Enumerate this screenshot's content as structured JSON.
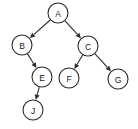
{
  "diagram": {
    "type": "directed-graph",
    "canvas": {
      "width": 138,
      "height": 129,
      "background": "#ffffff"
    },
    "style": {
      "node_fill": "#ffffff",
      "node_stroke": "#2b2b2b",
      "edge_color": "#2b2b2b",
      "label_color": "#1a1a1a",
      "node_radius": 10
    },
    "nodes": [
      {
        "id": "A",
        "label": "A",
        "cx": 58,
        "cy": 13,
        "r": 10
      },
      {
        "id": "B",
        "label": "B",
        "cx": 22,
        "cy": 45,
        "r": 10
      },
      {
        "id": "C",
        "label": "C",
        "cx": 88,
        "cy": 46,
        "r": 10
      },
      {
        "id": "E",
        "label": "E",
        "cx": 42,
        "cy": 77,
        "r": 10
      },
      {
        "id": "F",
        "label": "F",
        "cx": 69,
        "cy": 78,
        "r": 10
      },
      {
        "id": "G",
        "label": "G",
        "cx": 118,
        "cy": 79,
        "r": 10
      },
      {
        "id": "J",
        "label": "J",
        "cx": 33,
        "cy": 110,
        "r": 10
      }
    ],
    "edges": [
      {
        "id": "A-B",
        "from": "A",
        "to": "B",
        "directed": true
      },
      {
        "id": "A-C",
        "from": "A",
        "to": "C",
        "directed": true
      },
      {
        "id": "B-E",
        "from": "B",
        "to": "E",
        "directed": true
      },
      {
        "id": "C-F",
        "from": "C",
        "to": "F",
        "directed": true
      },
      {
        "id": "C-G",
        "from": "C",
        "to": "G",
        "directed": true
      },
      {
        "id": "E-J",
        "from": "E",
        "to": "J",
        "directed": true
      }
    ]
  }
}
